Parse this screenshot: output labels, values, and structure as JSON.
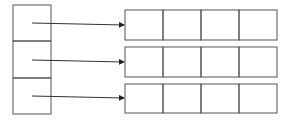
{
  "diagram": {
    "type": "array-of-pointers-to-arrays",
    "colors": {
      "stroke": "#444444",
      "background": "#ffffff"
    },
    "left_column": {
      "cells": 3,
      "x": 13,
      "y": 5,
      "width": 38,
      "height": 109
    },
    "rows": [
      {
        "index": 0,
        "cells": 4,
        "x": 125,
        "y": 10,
        "width": 152,
        "height": 30
      },
      {
        "index": 1,
        "cells": 4,
        "x": 125,
        "y": 47,
        "width": 152,
        "height": 30
      },
      {
        "index": 2,
        "cells": 4,
        "x": 125,
        "y": 84,
        "width": 152,
        "height": 29
      }
    ],
    "arrows": [
      {
        "from": [
          32,
          23
        ],
        "to": [
          125,
          25
        ]
      },
      {
        "from": [
          32,
          60
        ],
        "to": [
          125,
          62
        ]
      },
      {
        "from": [
          32,
          96
        ],
        "to": [
          125,
          98
        ]
      }
    ]
  }
}
